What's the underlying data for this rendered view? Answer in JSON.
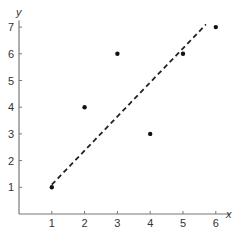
{
  "chart_data": {
    "type": "scatter",
    "title": "",
    "xlabel": "x",
    "ylabel": "y",
    "xlim": [
      0,
      6.3
    ],
    "ylim": [
      0,
      7.2
    ],
    "x_ticks": [
      1,
      2,
      3,
      4,
      5,
      6
    ],
    "y_ticks": [
      1,
      2,
      3,
      4,
      5,
      6,
      7
    ],
    "grid": false,
    "legend": null,
    "series": [
      {
        "name": "points",
        "type": "scatter",
        "marker": "dot",
        "x": [
          1,
          2,
          3,
          4,
          5,
          6
        ],
        "y": [
          1,
          4,
          6,
          3,
          6,
          7
        ]
      },
      {
        "name": "fit-line",
        "type": "line",
        "style": "dashed",
        "x": [
          1,
          5.7
        ],
        "y": [
          1.1,
          7.1
        ]
      }
    ]
  },
  "colors": {
    "axis": "#777777",
    "points": "#111111",
    "line": "#222222",
    "text": "#333333"
  }
}
